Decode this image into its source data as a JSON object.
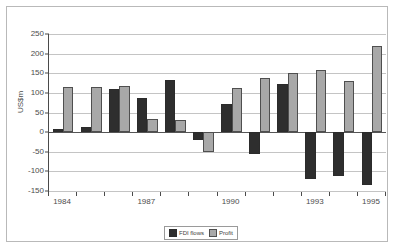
{
  "chart_data": {
    "type": "bar",
    "title": "",
    "subtitle": "",
    "xlabel": "",
    "ylabel": "US$m",
    "ylim": [
      -150,
      250
    ],
    "ytick_values": [
      250,
      200,
      150,
      100,
      50,
      0,
      -50,
      -100,
      -150
    ],
    "ytick_labels": [
      "250",
      "200",
      "150",
      "100",
      "50",
      "0",
      "-50",
      "-100",
      "-150"
    ],
    "grid": true,
    "legend_position": "bottom-center",
    "categories": [
      "1984",
      "1985",
      "1986",
      "1987",
      "1988",
      "1989",
      "1990",
      "1991",
      "1992",
      "1993",
      "1994",
      "1995"
    ],
    "xtick_labels_shown": [
      "1984",
      "1987",
      "1990",
      "1993",
      "1995"
    ],
    "series": [
      {
        "name": "FDI flows",
        "color": "#2e2e2e",
        "values": [
          8,
          14,
          110,
          88,
          132,
          -20,
          72,
          -55,
          122,
          -120,
          -112,
          -135
        ]
      },
      {
        "name": "Profit",
        "color": "#a8a8a8",
        "values": [
          115,
          115,
          118,
          33,
          32,
          -50,
          113,
          138,
          150,
          158,
          130,
          220
        ]
      }
    ]
  }
}
